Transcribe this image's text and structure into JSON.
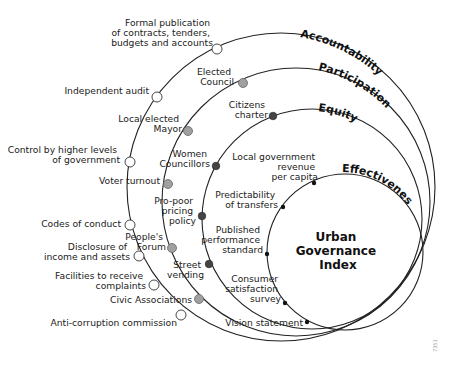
{
  "diagram": {
    "center_title": [
      "Urban",
      "Governance",
      "Index"
    ],
    "rings": [
      {
        "name": "Accountability",
        "dot_style": "open",
        "items": [
          "Formal publication of contracts, tenders, budgets and accounts",
          "Independent audit",
          "Control by higher levels of government",
          "Codes of conduct",
          "Disclosure of income and assets",
          "Facilities to receive complaints",
          "Anti-corruption commission"
        ]
      },
      {
        "name": "Participation",
        "dot_style": "light-grey",
        "items": [
          "Elected Council",
          "Local elected Mayor",
          "Voter turnout",
          "People's Forum",
          "Civic Associations"
        ]
      },
      {
        "name": "Equity",
        "dot_style": "dark-grey",
        "items": [
          "Citizens charter",
          "Women Councillors",
          "Pro-poor pricing policy",
          "Street vending"
        ]
      },
      {
        "name": "Effectiveness",
        "dot_style": "black",
        "items": [
          "Local government revenue per capita",
          "Predictability of transfers",
          "Published performance standard",
          "Consumer satisfaction survey",
          "Vision statement"
        ]
      }
    ],
    "labels": {
      "acc_1": [
        "Formal publication",
        "of contracts, tenders,",
        "budgets and accounts"
      ],
      "acc_2": [
        "Independent audit"
      ],
      "acc_3": [
        "Control by higher levels",
        "of government"
      ],
      "acc_4": [
        "Codes of conduct"
      ],
      "acc_5": [
        "Disclosure of",
        "income and assets"
      ],
      "acc_6": [
        "Facilities to receive",
        "complaints"
      ],
      "acc_7": [
        "Anti-corruption commission"
      ],
      "par_1": [
        "Elected",
        "Council"
      ],
      "par_2": [
        "Local elected",
        "Mayor"
      ],
      "par_3": [
        "Voter turnout"
      ],
      "par_4": [
        "People's",
        "Forum"
      ],
      "par_5": [
        "Civic Associations"
      ],
      "eq_1": [
        "Citizens",
        "charter"
      ],
      "eq_2": [
        "Women",
        "Councillors"
      ],
      "eq_3": [
        "Pro-poor",
        "pricing",
        "policy"
      ],
      "eq_4": [
        "Street",
        "vending"
      ],
      "eff_1": [
        "Local government",
        "revenue",
        "per capita"
      ],
      "eff_2": [
        "Predictability",
        "of transfers"
      ],
      "eff_3": [
        "Published",
        "performance",
        "standard"
      ],
      "eff_4": [
        "Consumer",
        "satisfaction",
        "survey"
      ],
      "eff_5": [
        "Vision statement"
      ]
    },
    "figure_id": "7351"
  }
}
